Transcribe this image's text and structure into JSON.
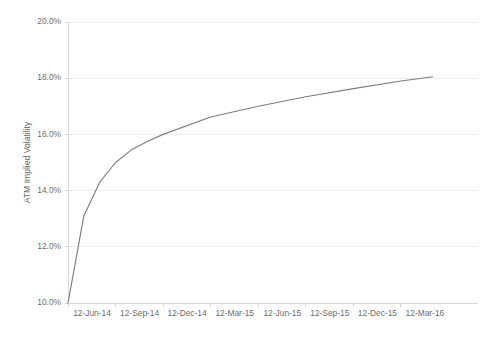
{
  "chart_data": {
    "type": "line",
    "title": "",
    "subtitle": "",
    "xlabel": "",
    "ylabel": "ATM Implied Volatility",
    "ylim": [
      10.0,
      20.0
    ],
    "ytick_values": [
      10.0,
      12.0,
      14.0,
      16.0,
      18.0,
      20.0
    ],
    "ytick_labels": [
      "10.0%",
      "12.0%",
      "14.0%",
      "16.0%",
      "18.0%",
      "20.0%"
    ],
    "xtick_labels": [
      "12-Jun-14",
      "12-Sep-14",
      "12-Dec-14",
      "12-Mar-15",
      "12-Jun-15",
      "12-Sep-15",
      "12-Dec-15",
      "12-Mar-16"
    ],
    "grid": true,
    "grid_axis": "y",
    "legend": false,
    "legend_position": "none",
    "series": [
      {
        "name": "ATM Implied Volatility",
        "color": "#7d7d7d",
        "x": [
          "12-Jun-14",
          "12-Jul-14",
          "12-Aug-14",
          "12-Sep-14",
          "12-Oct-14",
          "12-Nov-14",
          "12-Dec-14",
          "12-Mar-15",
          "12-Jun-15",
          "12-Sep-15",
          "12-Dec-15",
          "12-Mar-16",
          "12-May-16"
        ],
        "values": [
          10.0,
          13.1,
          14.3,
          15.0,
          15.45,
          15.75,
          16.0,
          16.62,
          17.0,
          17.34,
          17.63,
          17.9,
          18.05
        ]
      }
    ]
  },
  "axis_colors": {
    "gridline": "#e8e8e8",
    "axis": "#d2d2d2",
    "tick_text": "#6b6b6b",
    "series": "#7d7d7d",
    "background": "#ffffff"
  },
  "plot_geometry": {
    "left": 68,
    "right": 478,
    "top": 22,
    "bottom": 303
  }
}
